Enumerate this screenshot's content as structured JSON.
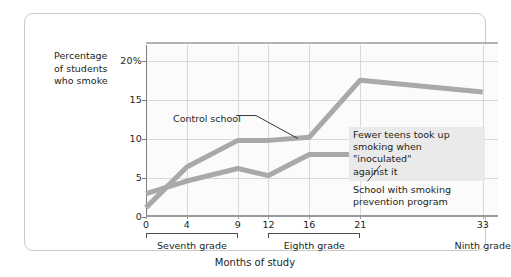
{
  "chart_data": {
    "type": "line",
    "title": "",
    "xlabel": "Months of study",
    "ylabel": "Percentage of students who smoke",
    "x": [
      0,
      4,
      9,
      12,
      16,
      21,
      33
    ],
    "xlim": [
      0,
      34.5
    ],
    "ylim": [
      0,
      22
    ],
    "grid": true,
    "legend_position": "annotations-inline",
    "xticks": [
      "0",
      "4",
      "9",
      "12",
      "16",
      "21",
      "33"
    ],
    "yticks": [
      "0",
      "5",
      "10",
      "15",
      "20%"
    ],
    "ytick_values": [
      0,
      5,
      10,
      15,
      20
    ],
    "series": [
      {
        "name": "Control school",
        "values": [
          1.2,
          6.4,
          9.8,
          9.8,
          10.2,
          17.5,
          16.0
        ]
      },
      {
        "name": "School with smoking prevention program",
        "values": [
          3.0,
          4.6,
          6.2,
          5.3,
          8.0,
          8.0,
          5.6
        ]
      }
    ],
    "annotations": [
      {
        "id": "control",
        "text": "Control school"
      },
      {
        "id": "inoculated",
        "text": "Fewer teens took up\nsmoking when \"inoculated\"\nagainst it"
      },
      {
        "id": "prevention",
        "text": "School with smoking\nprevention program"
      }
    ],
    "group_brackets": [
      {
        "label": "Seventh grade",
        "from": 0,
        "to": 9
      },
      {
        "label": "Eighth grade",
        "from": 12,
        "to": 21
      },
      {
        "label": "Ninth grade",
        "from": 33,
        "to": 33
      }
    ],
    "colors": {
      "line": "#a9a9a9",
      "grid": "#d8d8d8",
      "axis": "#7d7d7d",
      "text": "#231f20",
      "plot_background": "#fbfbfb",
      "annotation_highlight": "#eaeaea",
      "frame_border": "#c9c9c9"
    }
  },
  "axis": {
    "y_title_line1": "Percentage",
    "y_title_line2": "of students",
    "y_title_line3": "who smoke",
    "x_title": "Months of study"
  }
}
